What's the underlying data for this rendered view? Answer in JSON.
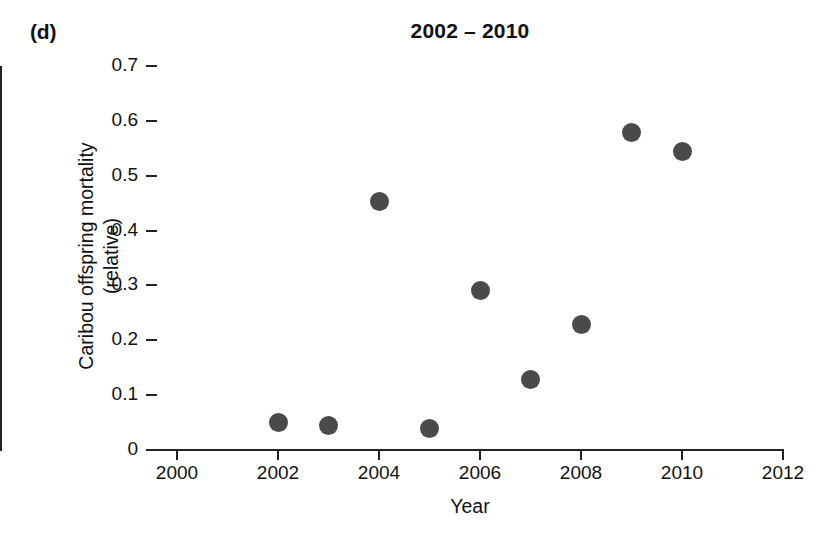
{
  "panel": {
    "label": "(d)"
  },
  "chart_data": {
    "type": "scatter",
    "title": "2002 – 2010",
    "xlabel": "Year",
    "ylabel_line1": "Caribou offspring mortality",
    "ylabel_line2": "(relative)",
    "xlim": [
      2000,
      2012
    ],
    "ylim": [
      0,
      0.7
    ],
    "xticks": [
      2000,
      2002,
      2004,
      2006,
      2008,
      2010,
      2012
    ],
    "xtick_labels": [
      "2000",
      "2002",
      "2004",
      "2006",
      "2008",
      "2010",
      "2012"
    ],
    "yticks": [
      0,
      0.1,
      0.2,
      0.3,
      0.4,
      0.5,
      0.6,
      0.7
    ],
    "ytick_labels": [
      "0",
      "0.1",
      "0.2",
      "0.3",
      "0.4",
      "0.5",
      "0.6",
      "0.7"
    ],
    "grid": false,
    "legend": false,
    "marker_color": "#4a4a4a",
    "marker_size_px": 19,
    "x": [
      2002,
      2003,
      2004,
      2005,
      2006,
      2007,
      2008,
      2009,
      2010
    ],
    "values": [
      0.05,
      0.045,
      0.453,
      0.04,
      0.29,
      0.128,
      0.228,
      0.578,
      0.545
    ],
    "points": [
      {
        "x": 2002,
        "y": 0.05
      },
      {
        "x": 2003,
        "y": 0.045
      },
      {
        "x": 2004,
        "y": 0.453
      },
      {
        "x": 2005,
        "y": 0.04
      },
      {
        "x": 2006,
        "y": 0.29
      },
      {
        "x": 2007,
        "y": 0.128
      },
      {
        "x": 2008,
        "y": 0.228
      },
      {
        "x": 2009,
        "y": 0.578
      },
      {
        "x": 2010,
        "y": 0.545
      }
    ]
  }
}
